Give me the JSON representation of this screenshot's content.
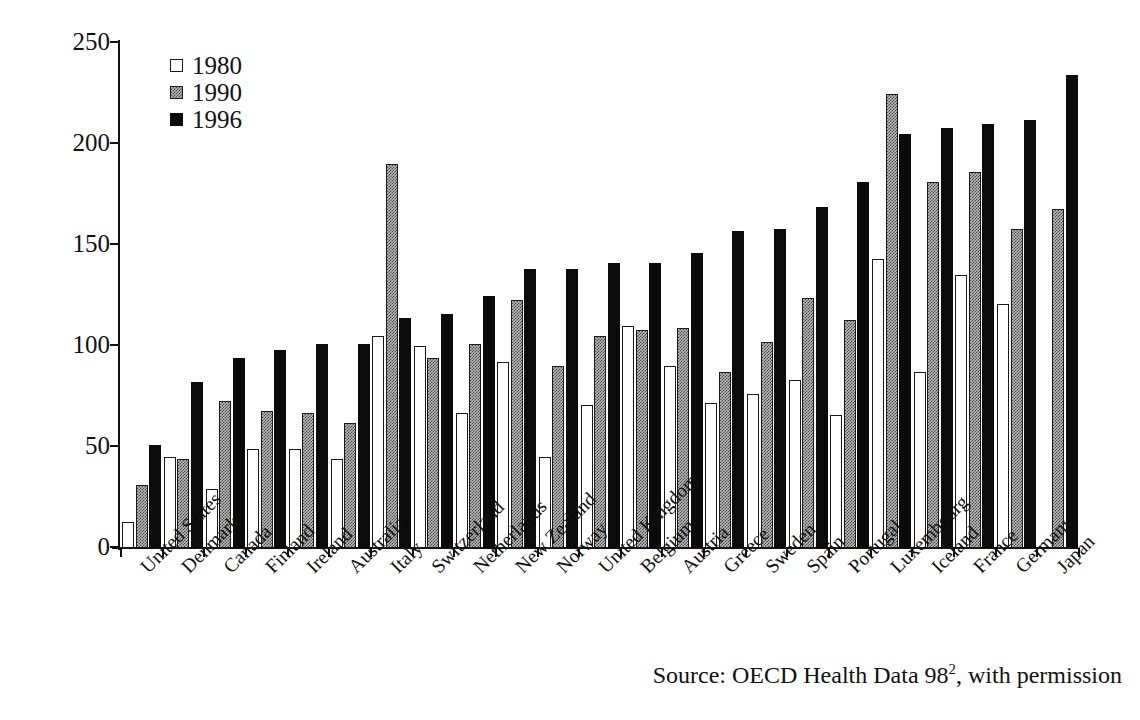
{
  "chart_data": {
    "type": "bar",
    "title": "",
    "subtitle": "",
    "xlabel": "",
    "ylabel": "",
    "ylim": [
      0,
      250
    ],
    "yticks": [
      0,
      50,
      100,
      150,
      200,
      250
    ],
    "grid": false,
    "legend_position": "top-left",
    "legend": [
      "1980",
      "1990",
      "1996"
    ],
    "categories": [
      "United States",
      "Denmark",
      "Canada",
      "Finland",
      "Ireland",
      "Australia",
      "Italy",
      "Switzerland",
      "Netherlands",
      "New Zealand",
      "Norway",
      "United Kingdom",
      "Belgium",
      "Austria",
      "Greece",
      "Sweden",
      "Spain",
      "Portugal",
      "Luxembourg",
      "Iceland",
      "France",
      "Germany",
      "Japan"
    ],
    "series": [
      {
        "name": "1980",
        "color": "#ffffff",
        "values": [
          13,
          45,
          29,
          49,
          49,
          44,
          105,
          100,
          67,
          92,
          45,
          71,
          110,
          90,
          72,
          76,
          83,
          66,
          143,
          87,
          135,
          121,
          null
        ]
      },
      {
        "name": "1990",
        "color": "#b9b9b9",
        "values": [
          31,
          44,
          73,
          68,
          67,
          62,
          190,
          94,
          101,
          123,
          90,
          105,
          108,
          109,
          87,
          102,
          124,
          113,
          225,
          181,
          186,
          158,
          168
        ]
      },
      {
        "name": "1996",
        "color": "#0b0b0b",
        "values": [
          51,
          82,
          94,
          98,
          101,
          101,
          114,
          116,
          125,
          138,
          138,
          141,
          141,
          146,
          157,
          158,
          169,
          181,
          205,
          208,
          210,
          212,
          234
        ]
      }
    ]
  },
  "source": {
    "prefix": "Source: OECD Health Data 98",
    "superscript": "2",
    "suffix": ", with permission"
  }
}
